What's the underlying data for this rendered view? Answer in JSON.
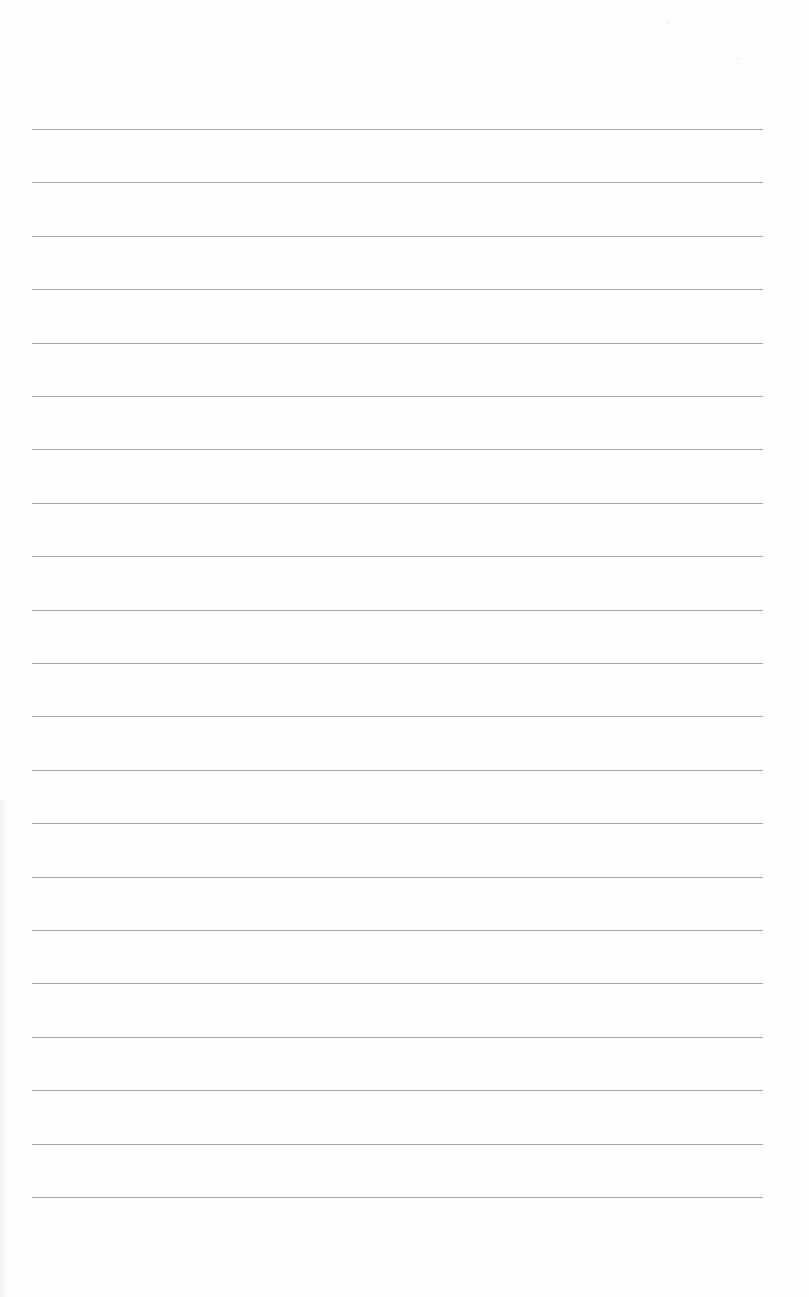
{
  "sheet": {
    "type": "lined-paper",
    "background_color": "#fefefe",
    "rule_color": "#9a9a9a",
    "rule_left_px": 32,
    "rule_right_px": 763,
    "first_rule_y_px": 129,
    "rule_spacing_px": 53.4,
    "rule_count": 21
  }
}
